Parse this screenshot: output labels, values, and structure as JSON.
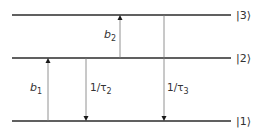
{
  "diagram": {
    "type": "energy-level-diagram",
    "colors": {
      "level_line": "#2b2b2b",
      "transition_line": "#777777",
      "arrowhead": "#1a1a1a",
      "text": "#333333"
    },
    "levels": [
      {
        "id": "3",
        "label": "|3⟩",
        "y": 15
      },
      {
        "id": "2",
        "label": "|2⟩",
        "y": 58
      },
      {
        "id": "1",
        "label": "|1⟩",
        "y": 121
      }
    ],
    "transitions": [
      {
        "id": "b1",
        "from": "1",
        "to": "2",
        "direction": "up",
        "x": 48,
        "label_main": "b",
        "label_sub": "1"
      },
      {
        "id": "tau2",
        "from": "2",
        "to": "1",
        "direction": "down",
        "x": 86,
        "label_main": "1/τ",
        "label_sub": "2"
      },
      {
        "id": "b2",
        "from": "2",
        "to": "3",
        "direction": "up",
        "x": 120,
        "label_main": "b",
        "label_sub": "2"
      },
      {
        "id": "tau3",
        "from": "3",
        "to": "1",
        "direction": "down",
        "x": 164,
        "label_main": "1/τ",
        "label_sub": "3"
      }
    ]
  }
}
